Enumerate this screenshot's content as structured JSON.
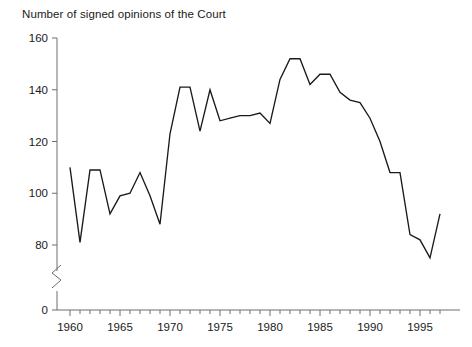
{
  "chart_data": {
    "type": "line",
    "title": "Number of signed opinions of the Court",
    "xlabel": "",
    "ylabel": "",
    "grid": false,
    "legend": null,
    "axis_break": true,
    "axis_break_note": "y-axis broken between 0 and 80",
    "xlim": [
      1959.5,
      1997.5
    ],
    "ylim": [
      0,
      160
    ],
    "y_ticks": [
      0,
      80,
      100,
      120,
      140,
      160
    ],
    "y_tick_labels": [
      "0",
      "80",
      "100",
      "120",
      "140",
      "160"
    ],
    "x_ticks": [
      1960,
      1965,
      1970,
      1975,
      1980,
      1985,
      1990,
      1995
    ],
    "x_tick_labels": [
      "1960",
      "1965",
      "1970",
      "1975",
      "1980",
      "1985",
      "1990",
      "1995"
    ],
    "x_minor_tick_step": 1,
    "line_color": "#1a1a1a",
    "axis_color": "#6e6e6e",
    "background_color": "#ffffff",
    "x": [
      1960,
      1961,
      1962,
      1963,
      1964,
      1965,
      1966,
      1967,
      1968,
      1969,
      1970,
      1971,
      1972,
      1973,
      1974,
      1975,
      1976,
      1977,
      1978,
      1979,
      1980,
      1981,
      1982,
      1983,
      1984,
      1985,
      1986,
      1987,
      1988,
      1989,
      1990,
      1991,
      1992,
      1993,
      1994,
      1995,
      1996,
      1997
    ],
    "values": [
      110,
      81,
      109,
      109,
      92,
      99,
      100,
      108,
      99,
      88,
      123,
      141,
      141,
      124,
      140,
      128,
      129,
      130,
      130,
      131,
      127,
      144,
      152,
      152,
      142,
      146,
      146,
      139,
      136,
      135,
      129,
      120,
      108,
      108,
      84,
      82,
      75,
      92
    ],
    "series": [
      {
        "name": "Number of signed opinions of the Court",
        "values": [
          110,
          81,
          109,
          109,
          92,
          99,
          100,
          108,
          99,
          88,
          123,
          141,
          141,
          124,
          140,
          128,
          129,
          130,
          130,
          131,
          127,
          144,
          152,
          152,
          142,
          146,
          146,
          139,
          136,
          135,
          129,
          120,
          108,
          108,
          84,
          82,
          75,
          92
        ]
      }
    ]
  }
}
